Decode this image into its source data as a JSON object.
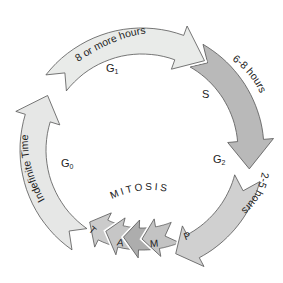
{
  "phases": [
    {
      "id": "g1",
      "phase": "G1",
      "phase_main": "G",
      "phase_sub": "1",
      "duration": "8 or more hours",
      "color": "#e9ebe9"
    },
    {
      "id": "s",
      "phase": "S",
      "phase_main": "S",
      "phase_sub": "",
      "duration": "6-8 hours",
      "color": "#b9b9b9"
    },
    {
      "id": "g2",
      "phase": "G2",
      "phase_main": "G",
      "phase_sub": "2",
      "duration": "2-5 hours",
      "color": "#d0d0d0"
    },
    {
      "id": "p",
      "phase": "P",
      "color": "#c3c3c3"
    },
    {
      "id": "m",
      "phase": "M",
      "color": "#adadad"
    },
    {
      "id": "a",
      "phase": "A",
      "color": "#c6c6c6"
    },
    {
      "id": "t",
      "phase": "T",
      "color": "#cbcbcb"
    },
    {
      "id": "g0",
      "phase": "G0",
      "phase_main": "G",
      "phase_sub": "0",
      "duration": "Indefinite Time",
      "color": "#e6e7e6"
    }
  ],
  "mitosis_label": "MITOSIS"
}
